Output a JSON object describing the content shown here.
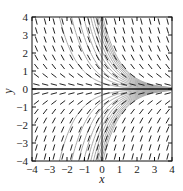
{
  "chart_data": {
    "type": "slope_field",
    "equation_implied": "dy/dx = -y",
    "title": "",
    "xlabel": "x",
    "ylabel": "y",
    "xlim": [
      -4,
      4
    ],
    "ylim": [
      -4,
      4
    ],
    "xticks": [
      -4,
      -3,
      -2,
      -1,
      0,
      1,
      2,
      3,
      4
    ],
    "yticks": [
      -4,
      -3,
      -2,
      -1,
      0,
      1,
      2,
      3,
      4
    ],
    "grid": false,
    "solution_curves": "y = C*e^(-x), gray",
    "colors": {
      "segments": "#222222",
      "curves": "#a8a8a8",
      "axes": "#111111"
    }
  },
  "labels": {
    "x": "x",
    "y": "y"
  },
  "xtick_labels": [
    "−4",
    "−3",
    "−2",
    "−1",
    "0",
    "1",
    "2",
    "3",
    "4"
  ],
  "ytick_labels": [
    "4",
    "3",
    "2",
    "1",
    "0",
    "−1",
    "−2",
    "−3",
    "−4"
  ]
}
